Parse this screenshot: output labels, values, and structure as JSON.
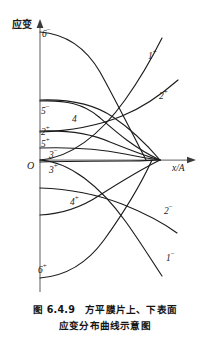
{
  "figure": {
    "caption_line1": "图 6.4.9　方平膜片上、下表面",
    "caption_line2": "应变分布曲线示意图",
    "y_axis_title": "应变",
    "x_axis_title": "x/A",
    "origin_label": "O"
  },
  "curve_labels": [
    {
      "id": "6-minus",
      "base": "6",
      "sign": "−",
      "x": 42,
      "y": 30
    },
    {
      "id": "1-plus",
      "base": "1",
      "sign": "+",
      "x": 148,
      "y": 52
    },
    {
      "id": "2-plus-r",
      "base": "2",
      "sign": "+",
      "x": 159,
      "y": 92
    },
    {
      "id": "5-minus",
      "base": "5",
      "sign": "−",
      "x": 41,
      "y": 107
    },
    {
      "id": "4-top",
      "base": "4",
      "sign": "",
      "x": 72,
      "y": 115
    },
    {
      "id": "2-plus-l",
      "base": "2",
      "sign": "+",
      "x": 41,
      "y": 128
    },
    {
      "id": "5-plus",
      "base": "5",
      "sign": "+",
      "x": 41,
      "y": 140
    },
    {
      "id": "3-minus",
      "base": "3",
      "sign": "−",
      "x": 49,
      "y": 151
    },
    {
      "id": "3-plus",
      "base": "3",
      "sign": "+",
      "x": 49,
      "y": 166
    },
    {
      "id": "4-plus",
      "base": "4",
      "sign": "+",
      "x": 70,
      "y": 198
    },
    {
      "id": "2-minus",
      "base": "2",
      "sign": "−",
      "x": 164,
      "y": 207
    },
    {
      "id": "1-minus",
      "base": "1",
      "sign": "−",
      "x": 166,
      "y": 254
    },
    {
      "id": "6-plus",
      "base": "6",
      "sign": "+",
      "x": 38,
      "y": 266
    }
  ],
  "chart_data": {
    "type": "line",
    "xlabel": "x/A",
    "ylabel": "应变",
    "grid": false,
    "legend": "inline-curve-labels",
    "axes": {
      "origin_px": [
        40,
        160
      ],
      "y_axis_top_px": 22,
      "y_axis_bottom_px": 292,
      "x_axis_right_px": 196,
      "convergence_point_px": [
        160,
        160
      ]
    },
    "note": "Schematic strain distribution curves on the upper (+) and lower (−) surfaces of a square flat diaphragm; all curves converge near x/A = 1.",
    "series": [
      {
        "name": "1+",
        "surface": "upper",
        "index": 1,
        "path": "M40,160 C70,158 100,135 125,100 C140,79 152,58 162,38"
      },
      {
        "name": "1−",
        "surface": "lower",
        "index": 1,
        "path": "M40,160 C70,162 100,186 126,222 C141,243 152,261 162,276"
      },
      {
        "name": "2+",
        "surface": "upper",
        "index": 2,
        "path": "M40,132 C68,131 95,127 122,116 C142,108 162,94 178,80"
      },
      {
        "name": "2−",
        "surface": "lower",
        "index": 2,
        "path": "M40,188 C68,189 96,194 122,204 C142,212 162,222 177,233"
      },
      {
        "name": "3−",
        "surface": "lower",
        "index": 3,
        "path": "M40,148 C70,147 100,149 125,154 C140,157 152,159 160,160"
      },
      {
        "name": "3+",
        "surface": "upper",
        "index": 3,
        "path": "M40,162 C72,161 104,161 130,161 C144,161 154,160 160,160"
      },
      {
        "name": "4",
        "surface": "upper",
        "index": 4,
        "path": "M40,101 C66,100 84,104 99,117 C115,131 134,148 160,160"
      },
      {
        "name": "4+",
        "surface": "upper",
        "index": 4,
        "path": "M40,215 C62,214 82,207 100,195 C122,181 144,168 160,160"
      },
      {
        "name": "5−",
        "surface": "lower",
        "index": 5,
        "path": "M40,100 C70,99 94,104 113,117 C131,129 148,146 160,160"
      },
      {
        "name": "5+",
        "surface": "upper",
        "index": 5,
        "path": "M40,131 C68,130 92,134 110,142 C130,150 148,157 160,160"
      },
      {
        "name": "6−",
        "surface": "lower",
        "index": 6,
        "path": "M40,32 C66,34 86,48 100,72 C115,99 132,133 146,160"
      },
      {
        "name": "6+",
        "surface": "upper",
        "index": 6,
        "path": "M40,278 C66,276 88,262 104,240 C122,215 141,184 152,160"
      }
    ]
  }
}
